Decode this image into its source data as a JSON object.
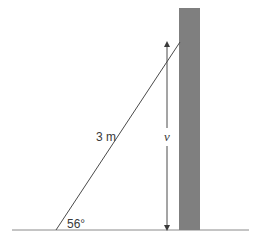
{
  "diagram": {
    "type": "ladder-against-wall",
    "ladder_length_label": "3 m",
    "angle_label": "56°",
    "height_label": "v",
    "colors": {
      "wall_fill": "#7f7f7f",
      "line": "#4a4a4a",
      "ground": "#8a8a8a",
      "text": "#3a3a3a"
    }
  }
}
